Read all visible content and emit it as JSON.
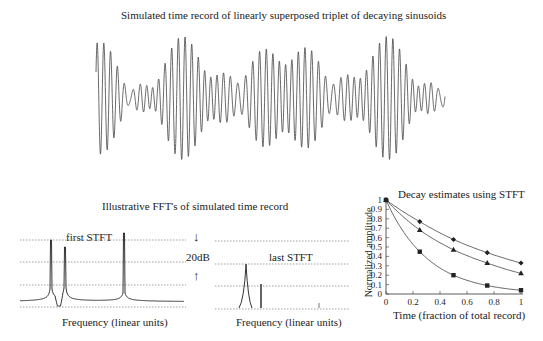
{
  "top": {
    "title": "Simulated  time record of linearly superposed triplet of decaying sinusoids"
  },
  "fft": {
    "title": "Illustrative FFT's of simulated time record",
    "first_label": "first STFT",
    "last_label": "last STFT",
    "db_label": "20dB",
    "arrow_down": "↓",
    "arrow_up": "↑",
    "xlabel_first": "Frequency (linear units)",
    "xlabel_last": "Frequency (linear units)"
  },
  "decay": {
    "title": "Decay estimates using STFT",
    "xlabel": "Time (fraction of total record)",
    "ylabel": "Normalized amplitude"
  },
  "chart_data": [
    {
      "type": "line",
      "title": "Simulated  time record of linearly superposed triplet of decaying sinusoids",
      "xlabel": "",
      "ylabel": "",
      "description": "Oscillating waveform, ~52 cycles, amplitude beating between ~0.6 and 1.0 of full scale",
      "grid": false
    },
    {
      "type": "line",
      "title": "first STFT",
      "xlabel": "Frequency (linear units)",
      "ylabel": "",
      "annotation": "20dB between dotted gridlines",
      "peaks_relative_x": [
        0.19,
        0.27,
        0.63
      ],
      "grid": true
    },
    {
      "type": "line",
      "title": "last STFT",
      "xlabel": "Frequency (linear units)",
      "ylabel": "",
      "peaks_relative_x": [
        0.23,
        0.34,
        0.83
      ],
      "grid": true
    },
    {
      "type": "line",
      "title": "Decay estimates using STFT",
      "xlabel": "Time (fraction of total record)",
      "ylabel": "Normalized amplitude",
      "x": [
        0,
        0.25,
        0.5,
        0.75,
        1.0
      ],
      "series": [
        {
          "name": "diamond",
          "marker": "diamond",
          "values": [
            1.0,
            0.77,
            0.58,
            0.44,
            0.33
          ]
        },
        {
          "name": "triangle",
          "marker": "triangle",
          "values": [
            1.0,
            0.68,
            0.47,
            0.33,
            0.22
          ]
        },
        {
          "name": "square",
          "marker": "square",
          "values": [
            1.0,
            0.45,
            0.2,
            0.09,
            0.04
          ]
        }
      ],
      "xlim": [
        0,
        1
      ],
      "ylim": [
        0,
        1
      ],
      "xticks": [
        "0",
        "0.2",
        "0.4",
        "0.6",
        "0.8",
        "1"
      ],
      "yticks": [
        "0",
        "0.1",
        "0.2",
        "0.3",
        "0.4",
        "0.5",
        "0.6",
        "0.7",
        "0.8",
        "0.9",
        "1"
      ],
      "grid": false
    }
  ]
}
